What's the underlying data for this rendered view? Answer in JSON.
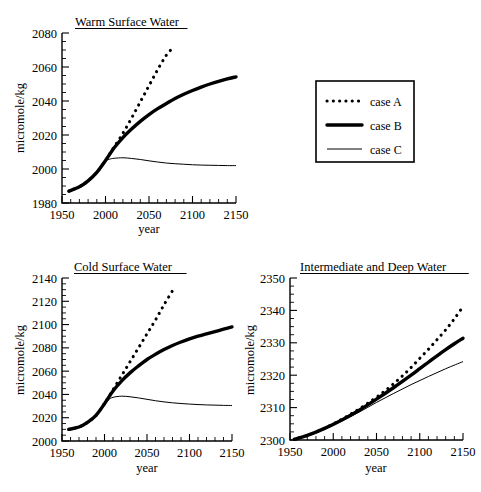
{
  "figure": {
    "name": "three-panel-ocean-carbon-projection",
    "xlabel": "year",
    "ylabel": "micromole/kg"
  },
  "legend": {
    "name": "case-legend",
    "entries": [
      {
        "label": "case A",
        "style": "dotted"
      },
      {
        "label": "case B",
        "style": "thick-solid"
      },
      {
        "label": "case C",
        "style": "thin-solid"
      }
    ]
  },
  "chart_data": [
    {
      "id": "warm",
      "type": "line",
      "title": "Warm Surface Water",
      "xlabel": "year",
      "ylabel": "micromole/kg",
      "xlim": [
        1950,
        2150
      ],
      "ylim": [
        1980,
        2080
      ],
      "xticks": [
        1950,
        2000,
        2050,
        2100,
        2150
      ],
      "yticks": [
        1980,
        2000,
        2020,
        2040,
        2060,
        2080
      ],
      "xminor_step": 10,
      "yminor_step": 5,
      "grid": false,
      "legend_position": "external-right",
      "series": [
        {
          "name": "case A",
          "style": "dotted",
          "x": [
            1958,
            1970,
            1980,
            1990,
            2000,
            2005,
            2010,
            2020,
            2030,
            2040,
            2050,
            2060,
            2070,
            2075
          ],
          "y": [
            1987,
            1989.5,
            1993,
            1998,
            2005,
            2009,
            2013,
            2021,
            2030,
            2039.5,
            2049,
            2058.5,
            2067,
            2070
          ]
        },
        {
          "name": "case B",
          "style": "thick-solid",
          "x": [
            1958,
            1970,
            1980,
            1990,
            2000,
            2010,
            2020,
            2030,
            2040,
            2050,
            2060,
            2070,
            2080,
            2090,
            2100,
            2110,
            2120,
            2130,
            2140,
            2150
          ],
          "y": [
            1987,
            1989.5,
            1993,
            1998,
            2005,
            2012.5,
            2018.5,
            2023.5,
            2028,
            2032,
            2035.5,
            2038.5,
            2041.5,
            2044,
            2046.2,
            2048.2,
            2050,
            2051.6,
            2053,
            2054.2
          ]
        },
        {
          "name": "case C",
          "style": "thin-solid",
          "x": [
            1958,
            1970,
            1980,
            1990,
            2000,
            2005,
            2010,
            2020,
            2030,
            2040,
            2050,
            2060,
            2070,
            2080,
            2090,
            2100,
            2110,
            2120,
            2130,
            2140,
            2150
          ],
          "y": [
            1987,
            1989.5,
            1993,
            1998,
            2004.5,
            2005.8,
            2006.3,
            2006.6,
            2006.2,
            2005.6,
            2004.8,
            2004.1,
            2003.5,
            2003.1,
            2002.8,
            2002.5,
            2002.3,
            2002.2,
            2002.1,
            2002.0,
            2002.0
          ]
        }
      ]
    },
    {
      "id": "cold",
      "type": "line",
      "title": "Cold Surface Water",
      "xlabel": "year",
      "ylabel": "micromole/kg",
      "xlim": [
        1950,
        2150
      ],
      "ylim": [
        2000,
        2140
      ],
      "xticks": [
        1950,
        2000,
        2050,
        2100,
        2150
      ],
      "yticks": [
        2000,
        2020,
        2040,
        2060,
        2080,
        2100,
        2120,
        2140
      ],
      "xminor_step": 10,
      "yminor_step": 5,
      "grid": false,
      "legend_position": "none",
      "series": [
        {
          "name": "case A",
          "style": "dotted",
          "x": [
            1958,
            1970,
            1980,
            1990,
            2000,
            2005,
            2010,
            2020,
            2030,
            2040,
            2050,
            2060,
            2070,
            2080
          ],
          "y": [
            2010,
            2012,
            2016,
            2022,
            2032,
            2038,
            2044,
            2056,
            2068,
            2080,
            2092,
            2104,
            2117,
            2129
          ]
        },
        {
          "name": "case B",
          "style": "thick-solid",
          "x": [
            1958,
            1970,
            1980,
            1990,
            2000,
            2010,
            2020,
            2030,
            2040,
            2050,
            2060,
            2070,
            2080,
            2090,
            2100,
            2110,
            2120,
            2130,
            2140,
            2150
          ],
          "y": [
            2010,
            2012,
            2016,
            2022,
            2032,
            2043,
            2051.5,
            2058.5,
            2064.5,
            2070,
            2074.5,
            2078.5,
            2082,
            2085,
            2087.7,
            2090,
            2092,
            2094,
            2096,
            2098
          ]
        },
        {
          "name": "case C",
          "style": "thin-solid",
          "x": [
            1958,
            1970,
            1980,
            1990,
            2000,
            2005,
            2010,
            2020,
            2030,
            2040,
            2050,
            2060,
            2070,
            2080,
            2090,
            2100,
            2110,
            2120,
            2130,
            2140,
            2150
          ],
          "y": [
            2010,
            2012,
            2016,
            2022,
            2031.5,
            2035.5,
            2037.5,
            2038.5,
            2038,
            2037,
            2035.8,
            2034.6,
            2033.6,
            2032.8,
            2032.2,
            2031.7,
            2031.3,
            2031.0,
            2030.8,
            2030.6,
            2030.5
          ]
        }
      ]
    },
    {
      "id": "deep",
      "type": "line",
      "title": "Intermediate and Deep Water",
      "xlabel": "year",
      "ylabel": "micromole/kg",
      "xlim": [
        1950,
        2150
      ],
      "ylim": [
        2300,
        2350
      ],
      "xticks": [
        1950,
        2000,
        2050,
        2100,
        2150
      ],
      "yticks": [
        2300,
        2310,
        2320,
        2330,
        2340,
        2350
      ],
      "xminor_step": 10,
      "yminor_step": 2.5,
      "grid": false,
      "legend_position": "none",
      "series": [
        {
          "name": "case A",
          "style": "dotted",
          "x": [
            1955,
            1970,
            1990,
            2010,
            2030,
            2050,
            2060,
            2070,
            2080,
            2090,
            2100,
            2110,
            2120,
            2130,
            2140,
            2150
          ],
          "y": [
            2300.2,
            2301.4,
            2303.6,
            2306.4,
            2309.6,
            2313.2,
            2315.2,
            2317.4,
            2319.8,
            2322.4,
            2325.2,
            2328.0,
            2331.0,
            2334.0,
            2337.4,
            2341.2
          ]
        },
        {
          "name": "case B",
          "style": "thick-solid",
          "x": [
            1955,
            1970,
            1990,
            2010,
            2030,
            2050,
            2070,
            2090,
            2100,
            2110,
            2120,
            2130,
            2140,
            2150
          ],
          "y": [
            2300.2,
            2301.4,
            2303.6,
            2306.2,
            2309.2,
            2312.6,
            2316.2,
            2320.0,
            2322.0,
            2324.0,
            2326.0,
            2327.9,
            2329.7,
            2331.4
          ]
        },
        {
          "name": "case C",
          "style": "thin-solid",
          "x": [
            1955,
            1970,
            1990,
            2010,
            2030,
            2050,
            2070,
            2090,
            2110,
            2130,
            2150
          ],
          "y": [
            2300.2,
            2301.3,
            2303.4,
            2305.9,
            2308.6,
            2311.6,
            2314.4,
            2317.1,
            2319.6,
            2322.0,
            2324.2
          ]
        }
      ]
    }
  ]
}
